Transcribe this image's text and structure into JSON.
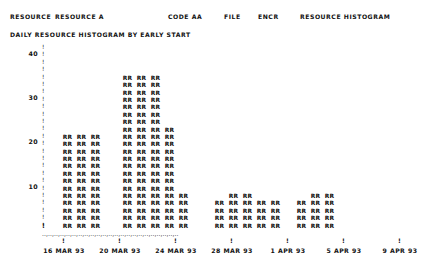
{
  "header": {
    "resource_label": "RESOURCE",
    "resource_value": "RESOURCE A",
    "code_label": "CODE AA",
    "file_label": "FILE",
    "encr_label": "ENCR",
    "report_title": "RESOURCE HISTOGRAM",
    "subtitle": "DAILY RESOURCE HISTOGRAM BY EARLY START"
  },
  "chart_data": {
    "type": "bar",
    "title": "DAILY RESOURCE HISTOGRAM BY EARLY START",
    "xlabel": "",
    "ylabel": "",
    "ylim": [
      0,
      42
    ],
    "yticks": [
      10,
      20,
      30,
      40
    ],
    "ytick_labels": [
      "10",
      "20",
      "30",
      "40"
    ],
    "grid": false,
    "legend": "none",
    "bar_glyph": "RR",
    "x_tick_labels": [
      "16 MAR 93",
      "20 MAR 93",
      "24 MAR 93",
      "28 MAR 93",
      "1 APR 93",
      "5 APR 93",
      "9 APR 93"
    ],
    "x_tick_positions": [
      62,
      118,
      174,
      230,
      286,
      342,
      398
    ],
    "categories": [
      "16 MAR 93",
      "17 MAR 93",
      "18 MAR 93",
      "19 MAR 93",
      "20 MAR 93",
      "21 MAR 93",
      "22 MAR 93",
      "23 MAR 93",
      "24 MAR 93",
      "25 MAR 93",
      "26 MAR 93",
      "27 MAR 93",
      "28 MAR 93",
      "29 MAR 93",
      "30 MAR 93",
      "31 MAR 93",
      "1 APR 93",
      "2 APR 93",
      "3 APR 93",
      "4 APR 93",
      "5 APR 93",
      "6 APR 93",
      "7 APR 93",
      "8 APR 93",
      "9 APR 93",
      "10 APR 93",
      "11 APR 93"
    ],
    "values": [
      22,
      22,
      22,
      0,
      0,
      0,
      0,
      0,
      35,
      35,
      35,
      23,
      9,
      0,
      0,
      0,
      7,
      9,
      9,
      7,
      7,
      0,
      0,
      7,
      9,
      9,
      0
    ],
    "bars": [
      {
        "x": 62,
        "value": 22,
        "date": "16 MAR 93"
      },
      {
        "x": 76,
        "value": 22,
        "date": "17 MAR 93"
      },
      {
        "x": 90,
        "value": 22,
        "date": "18 MAR 93"
      },
      {
        "x": 122,
        "value": 35,
        "date": "24 MAR 93"
      },
      {
        "x": 136,
        "value": 35,
        "date": "25 MAR 93"
      },
      {
        "x": 150,
        "value": 35,
        "date": "26 MAR 93"
      },
      {
        "x": 164,
        "value": 23,
        "date": "27 MAR 93"
      },
      {
        "x": 178,
        "value": 9,
        "date": "28 MAR 93"
      },
      {
        "x": 214,
        "value": 7,
        "date": "1 APR 93"
      },
      {
        "x": 228,
        "value": 9,
        "date": "2 APR 93"
      },
      {
        "x": 242,
        "value": 9,
        "date": "3 APR 93"
      },
      {
        "x": 256,
        "value": 7,
        "date": "4 APR 93"
      },
      {
        "x": 270,
        "value": 7,
        "date": "5 APR 93"
      },
      {
        "x": 296,
        "value": 7,
        "date": "7 APR 93"
      },
      {
        "x": 310,
        "value": 9,
        "date": "8 APR 93"
      },
      {
        "x": 324,
        "value": 9,
        "date": "9 APR 93"
      }
    ]
  }
}
